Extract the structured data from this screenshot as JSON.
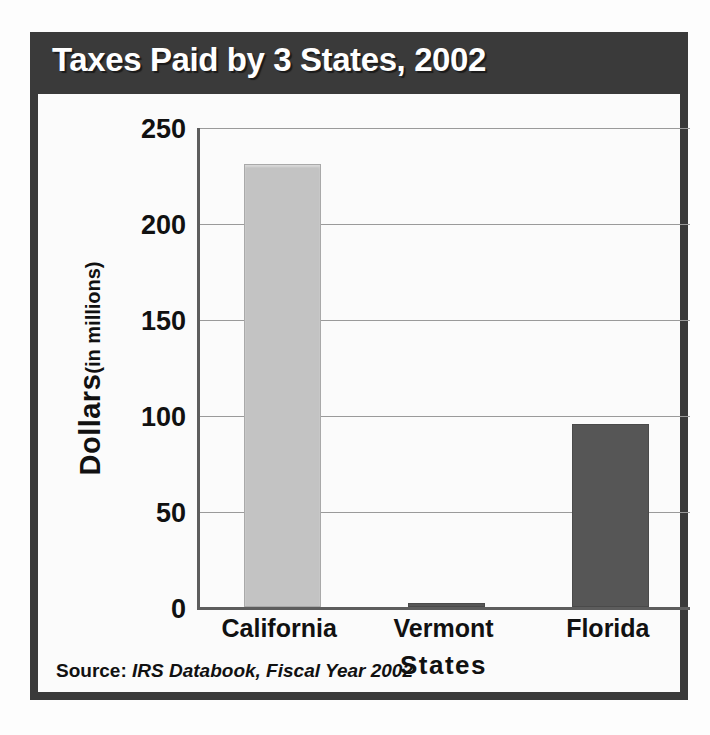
{
  "chart_data": {
    "type": "bar",
    "title": "Taxes Paid by 3 States, 2002",
    "categories": [
      "California",
      "Vermont",
      "Florida"
    ],
    "values": [
      230,
      2,
      95
    ],
    "xlabel": "States",
    "ylabel_main": "Dollars",
    "ylabel_unit": "(in millions)",
    "ylabel_full": "Dollars (in millions)",
    "ylim": [
      0,
      250
    ],
    "yticks": [
      "250",
      "200",
      "150",
      "100",
      "50",
      "0"
    ],
    "ytick_values": [
      250,
      200,
      150,
      100,
      50,
      0
    ],
    "grid": "horizontal",
    "legend": "none",
    "bar_colors": [
      "#c3c3c3",
      "#565656",
      "#565656"
    ],
    "source_prefix": "Source:",
    "source_italic": "IRS Databook, Fiscal Year 2002"
  },
  "style": {
    "frame_color": "#3a3a3a",
    "title_color": "#ffffff",
    "panel_color": "#fbfbfb",
    "axis_color": "#5d5d5d",
    "grid_color": "#9a9a9a",
    "text_color": "#111111"
  }
}
